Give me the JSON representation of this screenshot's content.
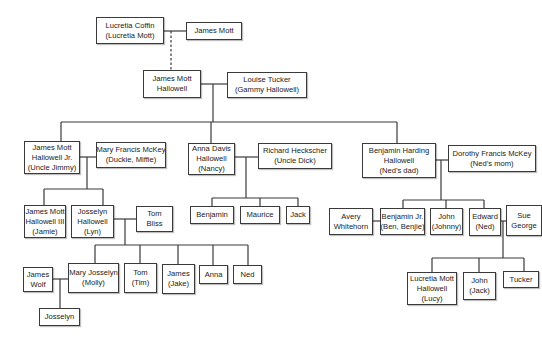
{
  "colors": {
    "line": "#3a3a3a",
    "box_border": "#3a3a3a",
    "text": "#222222",
    "background": "#ffffff"
  },
  "people": [
    {
      "id": "lucretia-coffin",
      "lines": [
        "Lucretia Coffin",
        "(Lucretia Mott)"
      ],
      "box": [
        96,
        17,
        68,
        27
      ]
    },
    {
      "id": "james-mott",
      "lines": [
        "James Mott"
      ],
      "box": [
        186,
        22,
        56,
        18
      ]
    },
    {
      "id": "james-mott-hallowell",
      "lines": [
        "James Mott",
        "Hallowell"
      ],
      "box": [
        143,
        70,
        58,
        28
      ]
    },
    {
      "id": "louise-tucker",
      "lines": [
        "Louise Tucker",
        "(Gammy Hallowell)"
      ],
      "box": [
        227,
        72,
        80,
        26
      ]
    },
    {
      "id": "james-mott-hallowell-jr",
      "lines": [
        "James Mott",
        "Hallowell Jr.",
        "(Uncle Jimmy)"
      ],
      "box": [
        24,
        141,
        56,
        33
      ]
    },
    {
      "id": "mary-francis-mckey",
      "lines": [
        "Mary Francis McKey",
        "(Duckie, Miffie)"
      ],
      "box": [
        96,
        142,
        70,
        26
      ]
    },
    {
      "id": "anna-davis-hallowell",
      "lines": [
        "Anna Davis",
        "Hallowell",
        "(Nancy)"
      ],
      "box": [
        188,
        143,
        47,
        32
      ]
    },
    {
      "id": "richard-heckscher",
      "lines": [
        "Richard Heckscher",
        "(Uncle Dick)"
      ],
      "box": [
        258,
        143,
        74,
        26
      ]
    },
    {
      "id": "benjamin-harding-hallowell",
      "lines": [
        "Benjamin Harding",
        "Hallowell",
        "(Ned’s dad)"
      ],
      "box": [
        362,
        143,
        74,
        35
      ]
    },
    {
      "id": "dorothy-francis-mckey",
      "lines": [
        "Dorothy Francis McKey",
        "(Ned’s mom)"
      ],
      "box": [
        448,
        145,
        88,
        27
      ]
    },
    {
      "id": "james-mott-hallowell-iii",
      "lines": [
        "James Mott",
        "Hallowell III",
        "(Jamie)"
      ],
      "box": [
        24,
        205,
        42,
        33
      ]
    },
    {
      "id": "josselyn-hallowell",
      "lines": [
        "Josselyn",
        "Hallowell",
        "(Lyn)"
      ],
      "box": [
        71,
        205,
        43,
        33
      ]
    },
    {
      "id": "tom-bliss",
      "lines": [
        "Tom",
        "Bliss"
      ],
      "box": [
        136,
        206,
        37,
        26
      ]
    },
    {
      "id": "benjamin",
      "lines": [
        "Benjamin"
      ],
      "box": [
        190,
        206,
        44,
        18
      ]
    },
    {
      "id": "maurice",
      "lines": [
        "Maurice"
      ],
      "box": [
        240,
        206,
        40,
        18
      ]
    },
    {
      "id": "jack",
      "lines": [
        "Jack"
      ],
      "box": [
        286,
        206,
        24,
        18
      ]
    },
    {
      "id": "avery-whitehorn",
      "lines": [
        "Avery",
        "Whitehorn"
      ],
      "box": [
        329,
        208,
        44,
        27
      ]
    },
    {
      "id": "benjamin-jr",
      "lines": [
        "Benjamin Jr.",
        "(Ben, Benjie)"
      ],
      "box": [
        380,
        208,
        45,
        27
      ]
    },
    {
      "id": "john-johnny",
      "lines": [
        "John",
        "(Johnny)"
      ],
      "box": [
        430,
        208,
        33,
        27
      ]
    },
    {
      "id": "edward-ned",
      "lines": [
        "Edward",
        "(Ned)"
      ],
      "box": [
        469,
        208,
        32,
        28
      ]
    },
    {
      "id": "sue-george",
      "lines": [
        "Sue",
        "George"
      ],
      "box": [
        506,
        205,
        36,
        31
      ]
    },
    {
      "id": "james-wolf",
      "lines": [
        "James",
        "Wolf"
      ],
      "box": [
        23,
        267,
        30,
        25
      ]
    },
    {
      "id": "mary-josselyn",
      "lines": [
        "Mary Josselyn",
        "(Molly)"
      ],
      "box": [
        68,
        263,
        51,
        30
      ]
    },
    {
      "id": "tom-tim",
      "lines": [
        "Tom",
        "(Tim)"
      ],
      "box": [
        124,
        263,
        33,
        30
      ]
    },
    {
      "id": "james-jake",
      "lines": [
        "James",
        "(Jake)"
      ],
      "box": [
        162,
        264,
        33,
        30
      ]
    },
    {
      "id": "anna",
      "lines": [
        "Anna"
      ],
      "box": [
        199,
        265,
        29,
        19
      ]
    },
    {
      "id": "ned",
      "lines": [
        "Ned"
      ],
      "box": [
        233,
        265,
        29,
        19
      ]
    },
    {
      "id": "josselyn",
      "lines": [
        "Josselyn"
      ],
      "box": [
        39,
        308,
        41,
        18
      ]
    },
    {
      "id": "lucretia-mott-hallowell",
      "lines": [
        "Lucretia Mott",
        "Hallowell",
        "(Lucy)"
      ],
      "box": [
        407,
        272,
        50,
        33
      ]
    },
    {
      "id": "john-jack",
      "lines": [
        "John",
        "(Jack)"
      ],
      "box": [
        463,
        272,
        33,
        28
      ]
    },
    {
      "id": "tucker",
      "lines": [
        "Tucker"
      ],
      "box": [
        503,
        271,
        36,
        17
      ]
    }
  ],
  "connectors": {
    "solid": [
      [
        164,
        31,
        186,
        31
      ],
      [
        201,
        84,
        227,
        84
      ],
      [
        213,
        84,
        213,
        122
      ],
      [
        61,
        122,
        397,
        122
      ],
      [
        61,
        122,
        61,
        141
      ],
      [
        211,
        122,
        211,
        143
      ],
      [
        397,
        122,
        397,
        143
      ],
      [
        80,
        157,
        96,
        157
      ],
      [
        87,
        157,
        87,
        189
      ],
      [
        44,
        189,
        103,
        189
      ],
      [
        44,
        189,
        44,
        205
      ],
      [
        103,
        189,
        103,
        205
      ],
      [
        235,
        157,
        258,
        157
      ],
      [
        246,
        157,
        246,
        198
      ],
      [
        212,
        198,
        298,
        198
      ],
      [
        212,
        198,
        212,
        206
      ],
      [
        260,
        198,
        260,
        206
      ],
      [
        298,
        198,
        298,
        206
      ],
      [
        436,
        160,
        448,
        160
      ],
      [
        441,
        160,
        441,
        200
      ],
      [
        403,
        200,
        484,
        200
      ],
      [
        403,
        200,
        403,
        208
      ],
      [
        446,
        200,
        446,
        208
      ],
      [
        484,
        200,
        484,
        208
      ],
      [
        373,
        221,
        380,
        221
      ],
      [
        501,
        221,
        506,
        221
      ],
      [
        503,
        221,
        503,
        258
      ],
      [
        432,
        258,
        524,
        258
      ],
      [
        432,
        258,
        432,
        272
      ],
      [
        479,
        258,
        479,
        272
      ],
      [
        524,
        258,
        524,
        271
      ],
      [
        114,
        219,
        136,
        219
      ],
      [
        125,
        219,
        125,
        245
      ],
      [
        95,
        245,
        248,
        245
      ],
      [
        95,
        245,
        95,
        263
      ],
      [
        140,
        245,
        140,
        263
      ],
      [
        178,
        245,
        178,
        264
      ],
      [
        213,
        245,
        213,
        265
      ],
      [
        248,
        245,
        248,
        265
      ],
      [
        53,
        279,
        68,
        279
      ],
      [
        60,
        279,
        60,
        308
      ]
    ],
    "dashed": [
      [
        171,
        31,
        171,
        70
      ]
    ]
  }
}
